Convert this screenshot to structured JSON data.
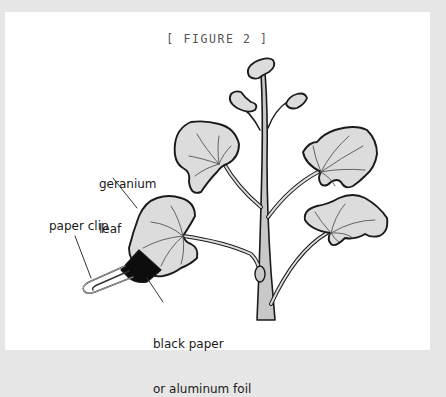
{
  "figure": {
    "title": "[ FIGURE 2 ]"
  },
  "labels": {
    "geranium_leaf_line1": "geranium",
    "geranium_leaf_line2": "leaf",
    "paper_clip": "paper clip",
    "foil_line1": "black paper",
    "foil_line2": "or aluminum foil"
  },
  "colors": {
    "page_background": "#e6e6e6",
    "card_background": "#ffffff",
    "leaf_fill": "#dcdcdc",
    "stem_fill": "#c8c8c8",
    "outline": "#1a1a1a",
    "foil": "#0d0d0d"
  }
}
